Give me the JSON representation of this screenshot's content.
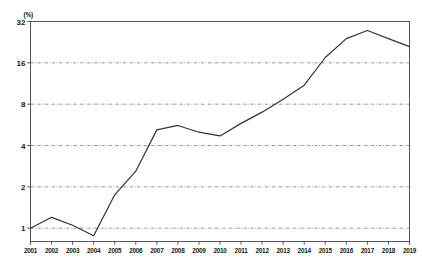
{
  "chart_data": {
    "type": "line",
    "title": "",
    "subtitle": "",
    "xlabel": "",
    "ylabel": "",
    "unit_label": "(%)",
    "yscale": "log",
    "ylim": [
      0.8,
      32
    ],
    "ytick_values": [
      1,
      2,
      4,
      8,
      16,
      32
    ],
    "ytick_labels": [
      "1",
      "2",
      "4",
      "8",
      "16",
      "32"
    ],
    "grid": true,
    "grid_style": "dashed-horizontal",
    "legend": "none",
    "categories": [
      "2001",
      "2002",
      "2003",
      "2004",
      "2005",
      "2006",
      "2007",
      "2008",
      "2009",
      "2010",
      "2011",
      "2012",
      "2013",
      "2014",
      "2015",
      "2016",
      "2017",
      "2018",
      "2019"
    ],
    "values": [
      1.0,
      1.2,
      1.05,
      0.88,
      1.75,
      2.6,
      5.2,
      5.6,
      5.0,
      4.7,
      5.8,
      7.0,
      8.7,
      11.0,
      17.5,
      24.0,
      27.5,
      24.0,
      21.0
    ],
    "line_color": "#333333",
    "line_width": 1.2,
    "axis_color": "#555555"
  }
}
